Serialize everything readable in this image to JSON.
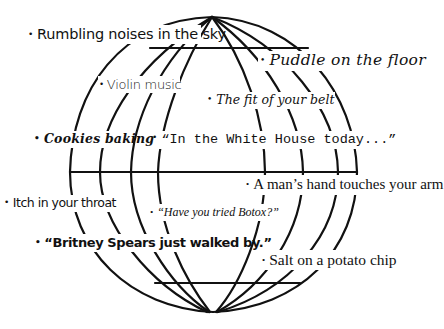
{
  "diagram": {
    "type": "globe-with-labels",
    "stroke_color": "#111111",
    "background_color": "#ffffff",
    "bullet": "•",
    "labels": [
      {
        "id": "rumbling",
        "text": "Rumbling noises in the sky"
      },
      {
        "id": "puddle",
        "text": "Puddle on the floor"
      },
      {
        "id": "violin",
        "text": "Violin music"
      },
      {
        "id": "belt",
        "text": "The fit of your belt"
      },
      {
        "id": "cookies",
        "text": "Cookies baking"
      },
      {
        "id": "whitehouse",
        "text": "“In the White House today...”"
      },
      {
        "id": "hand",
        "text": "A man’s hand touches your arm"
      },
      {
        "id": "itch",
        "text": "Itch in your throat"
      },
      {
        "id": "botox",
        "text": "“Have you tried Botox?”"
      },
      {
        "id": "britney",
        "text": "“Britney Spears just walked by.”"
      },
      {
        "id": "salt",
        "text": "Salt on a potato chip"
      }
    ]
  }
}
